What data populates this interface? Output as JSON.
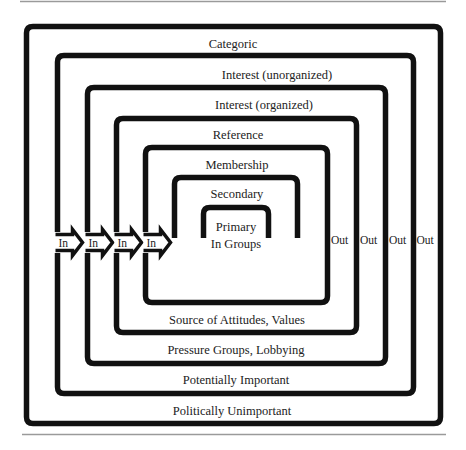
{
  "diagram": {
    "type": "nested-group-boundaries",
    "layers": [
      {
        "id": "categoric",
        "top_label": "Categoric",
        "bottom_label": "Politically Unimportant",
        "out_label": "Out",
        "in_label": "In"
      },
      {
        "id": "interest-unorganized",
        "top_label": "Interest (unorganized)",
        "bottom_label": "Potentially Important",
        "out_label": "Out",
        "in_label": "In"
      },
      {
        "id": "interest-organized",
        "top_label": "Interest (organized)",
        "bottom_label": "Pressure Groups, Lobbying",
        "out_label": "Out",
        "in_label": "In"
      },
      {
        "id": "reference",
        "top_label": "Reference",
        "bottom_label": "Source of Attitudes, Values",
        "out_label": "Out",
        "in_label": "In"
      },
      {
        "id": "membership",
        "top_label": "Membership",
        "bottom_label": "",
        "out_label": "",
        "in_label": ""
      },
      {
        "id": "secondary",
        "top_label": "Secondary",
        "bottom_label": "",
        "out_label": "",
        "in_label": ""
      },
      {
        "id": "primary",
        "top_label": "Primary",
        "sub_label": "In Groups",
        "bottom_label": "",
        "out_label": "",
        "in_label": ""
      }
    ],
    "colors": {
      "line": "#111111",
      "text": "#222222",
      "rule": "#9a9a9a",
      "background": "#ffffff"
    }
  }
}
